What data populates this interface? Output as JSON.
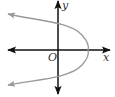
{
  "diagram": {
    "type": "coordinate-graph",
    "labels": {
      "x_axis": "x",
      "y_axis": "y",
      "origin": "O"
    },
    "colors": {
      "axes": "#111111",
      "curve": "#999999",
      "background": "#ffffff"
    },
    "curve": {
      "shape": "parabola",
      "opens": "left",
      "vertex_px": [
        88,
        50
      ],
      "y_intercepts_px": [
        [
          58,
          28
        ],
        [
          58,
          72
        ]
      ],
      "arrow_tips_px": [
        [
          8,
          14
        ],
        [
          8,
          85
        ]
      ]
    }
  }
}
